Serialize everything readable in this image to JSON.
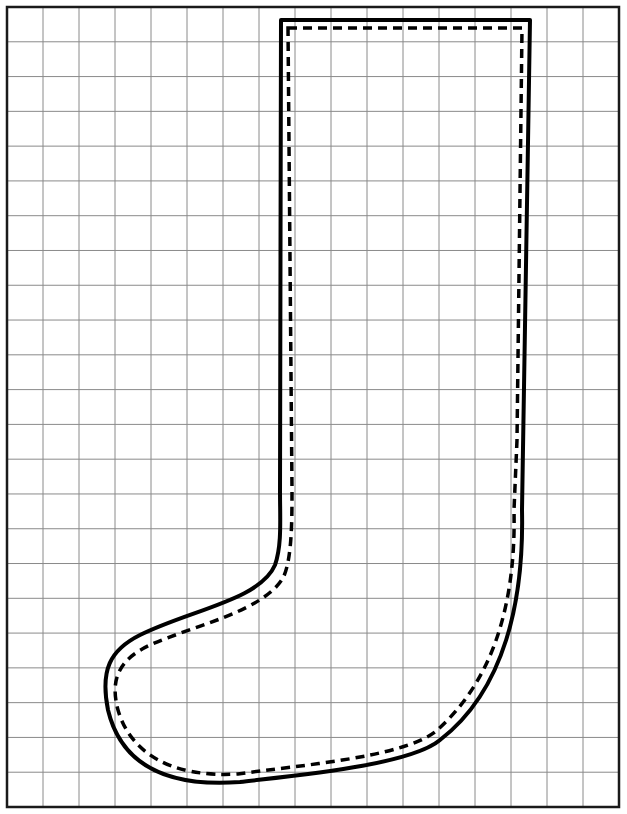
{
  "grid": {
    "left": 7,
    "top": 7,
    "right": 619,
    "bottom": 807,
    "columns": 17,
    "rows": 23,
    "line_color": "#8a8a8a",
    "border_color": "#1a1a1a"
  },
  "outline": {
    "cut_line": {
      "style": "solid",
      "color": "#000000",
      "width": 4
    },
    "seam_line": {
      "style": "dashed",
      "color": "#000000",
      "width": 3.5
    }
  },
  "legend": {
    "cut_line_label": "Cutting line",
    "seam_line_label": "Seam line"
  }
}
